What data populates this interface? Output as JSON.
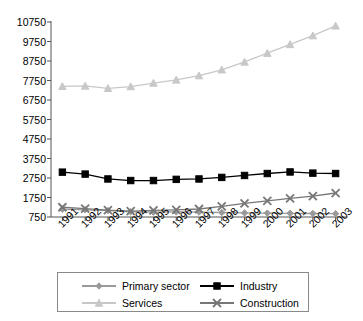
{
  "chart_data": {
    "type": "line",
    "title": "",
    "xlabel": "",
    "ylabel": "",
    "x": [
      "1991",
      "1992",
      "1993",
      "1994",
      "1995",
      "1996",
      "1997",
      "1998",
      "1999",
      "2000",
      "2001",
      "2002",
      "2003"
    ],
    "categories": [
      "1991",
      "1992",
      "1993",
      "1994",
      "1995",
      "1996",
      "1997",
      "1998",
      "1999",
      "2000",
      "2001",
      "2002",
      "2003"
    ],
    "ylim": [
      750,
      10750
    ],
    "yticks": [
      750,
      1750,
      2750,
      3750,
      4750,
      5750,
      6750,
      7750,
      8750,
      9750,
      10750
    ],
    "ytick_labels": [
      "750",
      "1750",
      "2750",
      "3750",
      "4750",
      "5750",
      "6750",
      "7750",
      "8750",
      "9750",
      "10750"
    ],
    "grid": false,
    "legend_position": "bottom",
    "series": [
      {
        "name": "Primary sector",
        "color": "#9a9a9a",
        "marker": "diamond",
        "values": [
          1150,
          1120,
          1080,
          1020,
          1000,
          1010,
          1000,
          980,
          960,
          950,
          940,
          930,
          920
        ]
      },
      {
        "name": "Industry",
        "color": "#000000",
        "marker": "square",
        "values": [
          3050,
          2950,
          2700,
          2620,
          2620,
          2680,
          2700,
          2780,
          2880,
          2980,
          3060,
          3000,
          2980
        ]
      },
      {
        "name": "Services",
        "color": "#c8c8c8",
        "marker": "triangle",
        "values": [
          7450,
          7470,
          7350,
          7440,
          7620,
          7780,
          8000,
          8300,
          8700,
          9150,
          9600,
          10050,
          10550
        ]
      },
      {
        "name": "Construction",
        "color": "#777777",
        "marker": "cross",
        "values": [
          1250,
          1180,
          1100,
          1050,
          1090,
          1120,
          1160,
          1300,
          1450,
          1580,
          1700,
          1820,
          1980
        ]
      }
    ]
  },
  "legend": {
    "items": [
      {
        "label": "Primary sector"
      },
      {
        "label": "Industry"
      },
      {
        "label": "Services"
      },
      {
        "label": "Construction"
      }
    ]
  }
}
